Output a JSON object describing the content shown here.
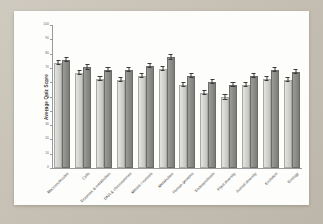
{
  "chart_data": {
    "type": "bar",
    "title": "",
    "xlabel": "",
    "ylabel": "Average Quiz Score",
    "ylim": [
      0,
      100
    ],
    "ytick_step": 10,
    "yticks": [
      0,
      10,
      20,
      30,
      40,
      50,
      60,
      70,
      80,
      90,
      100
    ],
    "grid": false,
    "legend": "none",
    "error_bars": true,
    "categories": [
      "Macromolecules",
      "Cells",
      "Enzymes & metabolism",
      "DNA & chromosomes",
      "Mitosis / meiosis",
      "Metabolism",
      "Human genetics",
      "Endosymbiosis",
      "Plant diversity",
      "Animal diversity",
      "Evolution",
      "Ecology"
    ],
    "series": [
      {
        "name": "Series 1",
        "color": "#d2d2cf",
        "values": [
          72,
          65,
          61,
          60,
          63,
          68,
          57,
          51,
          48,
          57,
          61,
          60
        ],
        "errors": [
          1.5,
          1.5,
          1.5,
          1.5,
          1.5,
          1.5,
          1.5,
          1.5,
          1.5,
          1.5,
          1.5,
          1.5
        ]
      },
      {
        "name": "Series 2",
        "color": "#8a8a87",
        "values": [
          74,
          69,
          67,
          67,
          70,
          76,
          63,
          59,
          57,
          63,
          67,
          66
        ],
        "errors": [
          1.5,
          1.5,
          1.5,
          1.5,
          1.5,
          1.5,
          1.5,
          1.5,
          1.5,
          1.5,
          1.5,
          1.5
        ]
      }
    ]
  },
  "figure": {
    "background_color": "#c9c3b8",
    "card_color": "#fdfdfc",
    "axis_color": "#9a9a9a",
    "tick_label_color": "#6d6d6d"
  }
}
